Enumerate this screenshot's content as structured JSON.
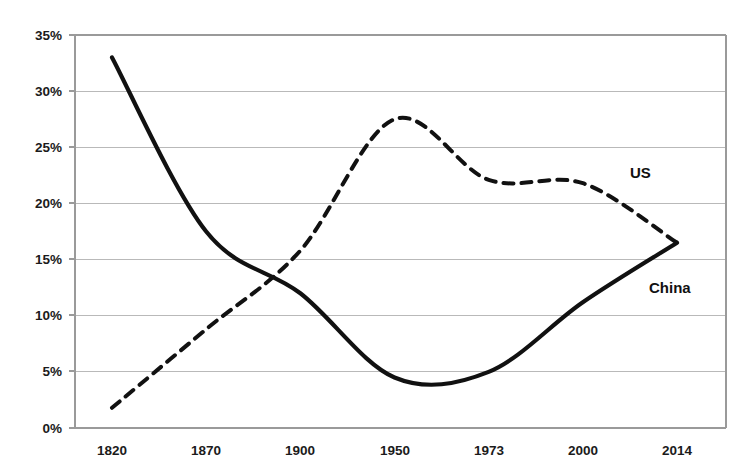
{
  "chart_data": {
    "type": "line",
    "title": "",
    "xlabel": "",
    "ylabel": "",
    "categories": [
      "1820",
      "1870",
      "1900",
      "1950",
      "1973",
      "2000",
      "2014"
    ],
    "ylim": [
      0,
      35
    ],
    "yticks": [
      0,
      5,
      10,
      15,
      20,
      25,
      30,
      35
    ],
    "ytick_labels": [
      "0%",
      "5%",
      "10%",
      "15%",
      "20%",
      "25%",
      "30%",
      "35%"
    ],
    "grid": true,
    "legend_position": "inline-labels",
    "series": [
      {
        "name": "China",
        "style": "solid",
        "values": [
          33.0,
          17.5,
          12.0,
          4.5,
          5.0,
          11.2,
          16.5
        ],
        "annotation": "China",
        "note": "declines steeply to a minimum of about 3.9% around 1960, then rises"
      },
      {
        "name": "US",
        "style": "dashed",
        "values": [
          1.8,
          8.8,
          15.8,
          27.5,
          22.1,
          21.8,
          16.5
        ],
        "annotation": "US",
        "note": "peaks at about 27.7% in the early 1950s, plateaus near 22% from 1973 to 2000"
      }
    ],
    "crossover": {
      "approx_year": "1885",
      "approx_value": 13.0
    }
  },
  "axis": {
    "y_tick_0": "0%",
    "y_tick_1": "5%",
    "y_tick_2": "10%",
    "y_tick_3": "15%",
    "y_tick_4": "20%",
    "y_tick_5": "25%",
    "y_tick_6": "30%",
    "y_tick_7": "35%",
    "x_tick_0": "1820",
    "x_tick_1": "1870",
    "x_tick_2": "1900",
    "x_tick_3": "1950",
    "x_tick_4": "1973",
    "x_tick_5": "2000",
    "x_tick_6": "2014"
  },
  "labels": {
    "us": "US",
    "china": "China"
  },
  "colors": {
    "line": "#111111",
    "grid": "#b9b9b9",
    "frame": "#9a9a9a",
    "text": "#1b1b1b",
    "background": "#ffffff"
  }
}
